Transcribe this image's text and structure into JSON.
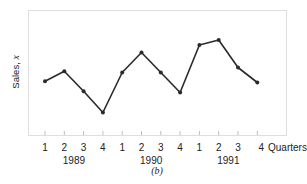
{
  "chart_data": {
    "type": "line",
    "title": "",
    "caption": "(b)",
    "xlabel": "Quarters",
    "ylabel": "Sales, x",
    "ylabel_main": "Sales, ",
    "ylabel_var": "x",
    "ylim": [
      0,
      10
    ],
    "y_ticks_shown": false,
    "grid": false,
    "legend": "none",
    "years": [
      {
        "label": "1989",
        "quarters": [
          "1",
          "2",
          "3",
          "4"
        ]
      },
      {
        "label": "1990",
        "quarters": [
          "1",
          "2",
          "3",
          "4"
        ]
      },
      {
        "label": "1991",
        "quarters": [
          "1",
          "2",
          "3",
          "4"
        ]
      }
    ],
    "categories": [
      "1989 Q1",
      "1989 Q2",
      "1989 Q3",
      "1989 Q4",
      "1990 Q1",
      "1990 Q2",
      "1990 Q3",
      "1990 Q4",
      "1991 Q1",
      "1991 Q2",
      "1991 Q3",
      "1991 Q4"
    ],
    "series": [
      {
        "name": "Sales",
        "values": [
          4.3,
          5.1,
          3.5,
          1.8,
          5.0,
          6.6,
          5.0,
          3.4,
          7.2,
          7.6,
          5.4,
          4.2
        ],
        "color": "#2a2a2a"
      }
    ],
    "frame_color": "#bdbdbd"
  }
}
